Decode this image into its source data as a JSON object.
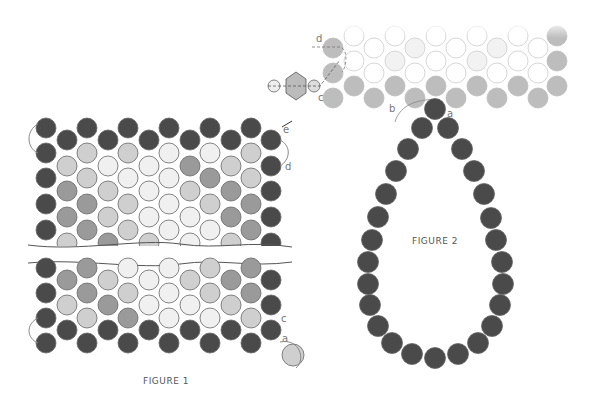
{
  "colors": {
    "dark": "#4a4a4a",
    "medium": "#9a9a9a",
    "light": "#cfcfcf",
    "pale": "#f0f0f0",
    "outline": "#666666",
    "thread": "#888888"
  },
  "figure1": {
    "caption": "FIGURE 1",
    "labels": {
      "a": "a",
      "c": "c",
      "d": "d",
      "e": "e"
    }
  },
  "figure2": {
    "caption": "FIGURE 2",
    "labels": {
      "a": "a",
      "b": "b",
      "c": "c",
      "d": "d"
    }
  }
}
